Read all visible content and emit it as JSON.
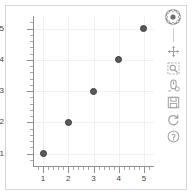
{
  "figure": {
    "background_color": "#ffffff",
    "border_color": "#d6d6d6",
    "grid_color": "#f0f0f0",
    "axis_color": "#8f8f8f",
    "marker_color": "#5a5a5a",
    "marker_line_color": "#3d3d3d"
  },
  "toolbar": {
    "logo_name": "bokeh-logo",
    "logo_title": "Bokeh",
    "tools": [
      {
        "name": "pan-tool",
        "label": "Pan"
      },
      {
        "name": "box-zoom-tool",
        "label": "Box Zoom"
      },
      {
        "name": "wheel-zoom-tool",
        "label": "Wheel Zoom"
      },
      {
        "name": "save-tool",
        "label": "Save"
      },
      {
        "name": "reset-tool",
        "label": "Reset"
      },
      {
        "name": "help-tool",
        "label": "Help"
      }
    ]
  },
  "chart_data": {
    "type": "scatter",
    "title": "",
    "xlabel": "",
    "ylabel": "",
    "xlim": [
      0.6,
      5.4
    ],
    "ylim": [
      0.6,
      5.4
    ],
    "grid": true,
    "legend": false,
    "x_ticks": [
      1,
      2,
      3,
      4,
      5
    ],
    "y_ticks": [
      1,
      2,
      3,
      4,
      5
    ],
    "x_tick_labels": [
      "1",
      "2",
      "3",
      "4",
      "5"
    ],
    "y_tick_labels": [
      "1",
      "2",
      "3",
      "4",
      "5"
    ],
    "x_minor_ticks_per_interval": 4,
    "y_minor_ticks_per_interval": 4,
    "marker": "circle",
    "marker_size": 7,
    "x": [
      1,
      2,
      3,
      4,
      5
    ],
    "y": [
      1,
      2,
      3,
      4,
      5
    ],
    "points": [
      {
        "x": 1,
        "y": 1
      },
      {
        "x": 2,
        "y": 2
      },
      {
        "x": 3,
        "y": 3
      },
      {
        "x": 4,
        "y": 4
      },
      {
        "x": 5,
        "y": 5
      }
    ]
  }
}
